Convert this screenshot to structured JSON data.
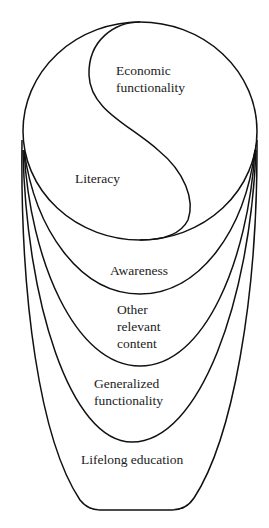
{
  "diagram": {
    "type": "nested-yin-yang-funnel",
    "regions": [
      {
        "id": "economic",
        "label_lines": [
          "Economic",
          "functionality"
        ]
      },
      {
        "id": "literacy",
        "label_lines": [
          "Literacy"
        ]
      },
      {
        "id": "awareness",
        "label_lines": [
          "Awareness"
        ]
      },
      {
        "id": "other",
        "label_lines": [
          "Other",
          "relevant",
          "content"
        ]
      },
      {
        "id": "generalized",
        "label_lines": [
          "Generalized",
          "functionality"
        ]
      },
      {
        "id": "lifelong",
        "label_lines": [
          "Lifelong education"
        ]
      }
    ],
    "stroke_color": "#111111",
    "background": "#ffffff"
  }
}
